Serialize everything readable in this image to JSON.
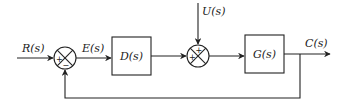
{
  "diagram": {
    "type": "control-system-block-diagram",
    "signals": {
      "input": "R(s)",
      "error": "E(s)",
      "disturbance": "U(s)",
      "output": "C(s)"
    },
    "blocks": [
      {
        "id": "controller",
        "label": "D(s)"
      },
      {
        "id": "plant",
        "label": "G(s)"
      }
    ],
    "summing_junctions": [
      {
        "id": "sum1",
        "signs": {
          "left": "+",
          "bottom": "−"
        }
      },
      {
        "id": "sum2",
        "signs": {
          "left": "+",
          "top": "+"
        }
      }
    ],
    "connections": [
      {
        "from": "R(s)",
        "to": "sum1",
        "sign": "+"
      },
      {
        "from": "sum1",
        "to": "controller",
        "signal": "E(s)"
      },
      {
        "from": "controller",
        "to": "sum2",
        "sign": "+"
      },
      {
        "from": "U(s)",
        "to": "sum2",
        "sign": "+"
      },
      {
        "from": "sum2",
        "to": "plant"
      },
      {
        "from": "plant",
        "to": "C(s)"
      },
      {
        "from": "C(s)",
        "to": "sum1",
        "sign": "−",
        "type": "feedback"
      }
    ]
  }
}
